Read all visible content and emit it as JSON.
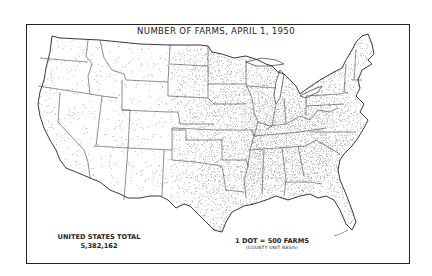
{
  "map": {
    "title": "NUMBER OF FARMS, APRIL 1, 1950",
    "total_label": "UNITED STATES TOTAL",
    "total_value": "5,382,162",
    "legend_dot": "1 DOT = 500 FARMS",
    "legend_basis": "(COUNTY UNIT BASIS)",
    "region": "Contiguous United States",
    "symbolization": "dot density",
    "colors": {
      "ink": "#222222",
      "background": "#ffffff"
    }
  }
}
